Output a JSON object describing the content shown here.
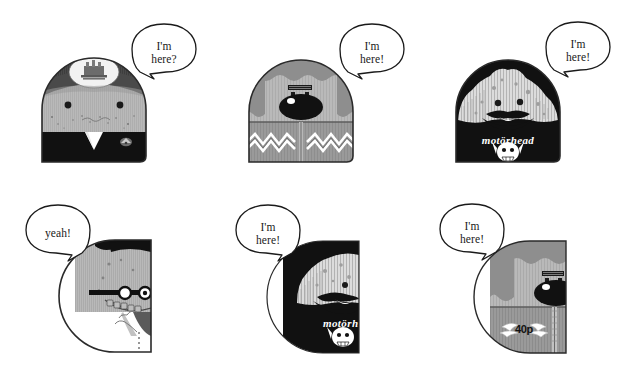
{
  "page": {
    "background_color": "#ffffff",
    "width": 625,
    "height": 367
  },
  "palette": {
    "ink": "#1a1a1a",
    "black": "#111111",
    "dark_gray": "#4a4a4a",
    "mid_gray": "#8e8e8e",
    "light_gray": "#b9b9b9",
    "pale_gray": "#d5d5d5",
    "white": "#ffffff",
    "outline": "#222222"
  },
  "characters": [
    {
      "id": "char-1",
      "name": "suited-figure",
      "row": "top",
      "column": 1,
      "cropped": false,
      "shape": "rounded-arch",
      "bubble": {
        "lines": [
          "I'm",
          "here?"
        ],
        "tail": "left-down"
      },
      "features": {
        "hair_color": "#4a4a4a",
        "face_color": "#b9b9b9",
        "body_color": "#111111",
        "eyes": 2,
        "has_crest_patch": true,
        "has_collar": true,
        "has_badge": true,
        "logo_text": ""
      }
    },
    {
      "id": "char-2",
      "name": "zigzag-sweater-figure",
      "row": "top",
      "column": 2,
      "cropped": false,
      "shape": "rounded-arch",
      "bubble": {
        "lines": [
          "I'm",
          "here!"
        ],
        "tail": "left-down"
      },
      "features": {
        "hair_color": "#8e8e8e",
        "face_color": "#b9b9b9",
        "body_color": "#9a9a9a",
        "eyes": 2,
        "has_big_nose": true,
        "has_zipper": true,
        "has_zigzag_pattern": true,
        "logo_text": ""
      }
    },
    {
      "id": "char-3",
      "name": "motorhead-figure",
      "row": "top",
      "column": 3,
      "cropped": false,
      "shape": "rounded-arch",
      "bubble": {
        "lines": [
          "I'm",
          "here!"
        ],
        "tail": "left-down"
      },
      "features": {
        "hair_color": "#111111",
        "face_color": "#dcdcdc",
        "body_color": "#111111",
        "eyes": 2,
        "has_beard": true,
        "has_mustache": true,
        "logo_text": "motörhead",
        "has_skull_emblem": true
      }
    },
    {
      "id": "char-4",
      "name": "glasses-figure-cropped",
      "row": "bottom",
      "column": 1,
      "cropped": true,
      "shape": "half-circle-left",
      "bubble": {
        "lines": [
          "yeah!"
        ],
        "tail": "right-down"
      },
      "features": {
        "hair_color": "#111111",
        "face_color": "#b9b9b9",
        "body_color": "#ffffff",
        "eyes": 2,
        "has_glasses": true,
        "has_toothy_grin": true,
        "has_dotted_seam": true,
        "logo_text": ""
      }
    },
    {
      "id": "char-5",
      "name": "motorhead-figure-cropped",
      "row": "bottom",
      "column": 2,
      "cropped": true,
      "shape": "half-circle-left",
      "bubble": {
        "lines": [
          "I'm",
          "here!"
        ],
        "tail": "right-down"
      },
      "features": {
        "hair_color": "#111111",
        "face_color": "#dcdcdc",
        "body_color": "#111111",
        "eyes": 2,
        "has_beard": true,
        "logo_text": "motörh",
        "has_skull_emblem": true
      }
    },
    {
      "id": "char-6",
      "name": "forty-p-figure-cropped",
      "row": "bottom",
      "column": 3,
      "cropped": true,
      "shape": "half-circle-left",
      "bubble": {
        "lines": [
          "I'm",
          "here!"
        ],
        "tail": "right-down"
      },
      "features": {
        "hair_color": "#8e8e8e",
        "face_color": "#b9b9b9",
        "body_color": "#9a9a9a",
        "eyes": 2,
        "has_big_nose": true,
        "has_zipper": true,
        "logo_text": "40p",
        "has_wing_emblem": true
      }
    }
  ]
}
